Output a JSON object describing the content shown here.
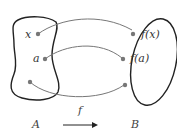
{
  "diagram": {
    "sets": [
      {
        "id": "A",
        "label": "A"
      },
      {
        "id": "B",
        "label": "B"
      }
    ],
    "domain_points": [
      {
        "label": "x"
      },
      {
        "label": "a"
      },
      {
        "label": ""
      }
    ],
    "codomain_points": [
      {
        "label": "f(x)"
      },
      {
        "label": "f(a)"
      },
      {
        "label": ""
      }
    ],
    "function": {
      "label": "f"
    },
    "colors": {
      "outline": "#222222",
      "arrow": "#777777",
      "dot": "#777777",
      "text": "#333333"
    }
  }
}
